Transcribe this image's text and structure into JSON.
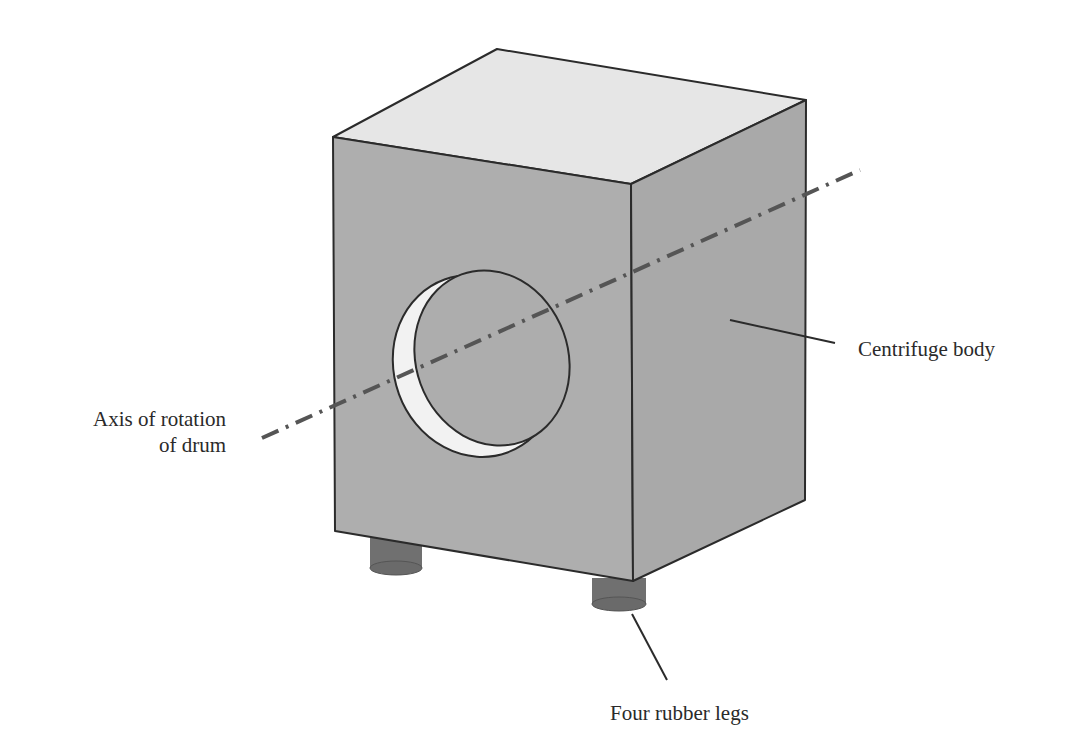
{
  "labels": {
    "body": "Centrifuge body",
    "axis_line1": "Axis of rotation",
    "axis_line2": "of drum",
    "legs": "Four rubber legs"
  },
  "colors": {
    "top_face": "#e6e6e6",
    "front_face": "#aeaeae",
    "side_face": "#a8a8a8",
    "legs": "#6e6e6e",
    "outline": "#2b2b2b",
    "axis": "#555555"
  }
}
